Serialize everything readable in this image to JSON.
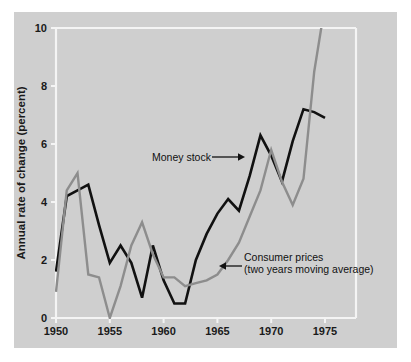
{
  "chart_data": {
    "type": "line",
    "title": "",
    "subtitle": "",
    "xlabel": "",
    "ylabel": "Annual rate of change (percent)",
    "xlim": [
      1950,
      1976
    ],
    "ylim": [
      0,
      10
    ],
    "grid": false,
    "legend_position": "inline-annotations",
    "x_ticks": [
      1950,
      1955,
      1960,
      1965,
      1970,
      1975
    ],
    "x_tick_labels": [
      "1950",
      "1955",
      "1960",
      "1965",
      "1970",
      "1975"
    ],
    "y_ticks": [
      0,
      2,
      4,
      6,
      8,
      10
    ],
    "y_tick_labels": [
      "0",
      "2",
      "4",
      "6",
      "8",
      "10"
    ],
    "series": [
      {
        "name": "Money stock",
        "color": "#111111",
        "x": [
          1950,
          1951,
          1952,
          1953,
          1954,
          1955,
          1956,
          1957,
          1958,
          1959,
          1960,
          1961,
          1962,
          1963,
          1964,
          1965,
          1966,
          1967,
          1968,
          1969,
          1970,
          1971,
          1972,
          1973,
          1974,
          1975
        ],
        "values": [
          1.6,
          4.2,
          4.4,
          4.6,
          3.2,
          1.9,
          2.5,
          1.9,
          0.7,
          2.5,
          1.3,
          0.5,
          0.5,
          2.0,
          2.9,
          3.6,
          4.1,
          3.7,
          4.9,
          6.3,
          5.6,
          4.7,
          6.1,
          7.2,
          7.1,
          6.9
        ]
      },
      {
        "name": "Consumer prices (two years moving average)",
        "color": "#8d8d8d",
        "x": [
          1950,
          1951,
          1952,
          1953,
          1954,
          1955,
          1956,
          1957,
          1958,
          1959,
          1960,
          1961,
          1962,
          1963,
          1964,
          1965,
          1966,
          1967,
          1968,
          1969,
          1970,
          1971,
          1972,
          1973,
          1974,
          1975
        ],
        "values": [
          0.9,
          4.4,
          5.0,
          1.5,
          1.4,
          0.0,
          1.1,
          2.5,
          3.3,
          2.2,
          1.4,
          1.4,
          1.1,
          1.2,
          1.3,
          1.5,
          2.0,
          2.6,
          3.5,
          4.4,
          5.8,
          4.7,
          3.9,
          4.8,
          8.5,
          10.8
        ]
      }
    ],
    "annotations": [
      {
        "id": "money-stock",
        "label": "Money stock",
        "arrow": "right",
        "text_x": 152,
        "text_y": 157,
        "arrow_from_x": 212,
        "arrow_to_x": 240,
        "arrow_y": 154
      },
      {
        "id": "consumer-prices",
        "label_line1": "Consumer prices",
        "label_line2": "(two years moving average)",
        "arrow": "left",
        "text_x": 244,
        "text_y": 258,
        "arrow_from_x": 242,
        "arrow_to_x": 223,
        "arrow_y": 263
      }
    ]
  },
  "colors": {
    "figure_background": "#ffffff",
    "plot_background": "#cfcfcf",
    "axis_line": "#f2f2f2",
    "money_stock": "#111111",
    "consumer_prices": "#8d8d8d",
    "text": "#1a1a1a"
  }
}
